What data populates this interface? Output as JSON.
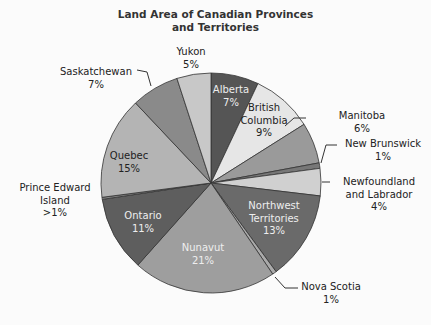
{
  "chart_data": {
    "type": "pie",
    "title": "Land Area of Canadian Provinces and Territories",
    "title_lines": [
      "Land Area of Canadian Provinces",
      "and Territories"
    ],
    "start_angle_deg": 0,
    "direction": "clockwise",
    "slices": [
      {
        "name": "Alberta",
        "label": "Alberta",
        "pct_label": "7%",
        "value": 7,
        "color": "#555555"
      },
      {
        "name": "British Columbia",
        "label": "British Columbia",
        "pct_label": "9%",
        "value": 9,
        "color": "#e6e6e6"
      },
      {
        "name": "Manitoba",
        "label": "Manitoba",
        "pct_label": "6%",
        "value": 6,
        "color": "#9a9a9a"
      },
      {
        "name": "New Brunswick",
        "label": "New Brunswick",
        "pct_label": "1%",
        "value": 0.8,
        "color": "#777777"
      },
      {
        "name": "Newfoundland and Labrador",
        "label": "Newfoundland and Labrador",
        "pct_label": "4%",
        "value": 4,
        "color": "#d0d0d0"
      },
      {
        "name": "Northwest Territories",
        "label": "Northwest Territories",
        "pct_label": "13%",
        "value": 13,
        "color": "#6a6a6a"
      },
      {
        "name": "Nova Scotia",
        "label": "Nova Scotia",
        "pct_label": "1%",
        "value": 0.6,
        "color": "#aaaaaa"
      },
      {
        "name": "Nunavut",
        "label": "Nunavut",
        "pct_label": "21%",
        "value": 21,
        "color": "#9e9e9e"
      },
      {
        "name": "Ontario",
        "label": "Ontario",
        "pct_label": "11%",
        "value": 11,
        "color": "#5e5e5e"
      },
      {
        "name": "Prince Edward Island",
        "label": "Prince Edward Island",
        "pct_label": ">1%",
        "value": 0.3,
        "color": "#888888"
      },
      {
        "name": "Quebec",
        "label": "Quebec",
        "pct_label": "15%",
        "value": 15,
        "color": "#b4b4b4"
      },
      {
        "name": "Saskatchewan",
        "label": "Saskatchewan",
        "pct_label": "7%",
        "value": 7,
        "color": "#8a8a8a"
      },
      {
        "name": "Yukon",
        "label": "Yukon",
        "pct_label": "5%",
        "value": 5,
        "color": "#c8c8c8"
      }
    ],
    "legend": "none (callout labels)"
  },
  "labels": {
    "alberta": [
      "Alberta",
      "7%"
    ],
    "bc": [
      "British",
      "Columbia",
      "9%"
    ],
    "manitoba": [
      "Manitoba",
      "6%"
    ],
    "nb": [
      "New Brunswick",
      "1%"
    ],
    "nl": [
      "Newfoundland",
      "and Labrador",
      "4%"
    ],
    "nwt": [
      "Northwest",
      "Territories",
      "13%"
    ],
    "ns": [
      "Nova Scotia",
      "1%"
    ],
    "nunavut": [
      "Nunavut",
      "21%"
    ],
    "ontario": [
      "Ontario",
      "11%"
    ],
    "pei": [
      "Prince Edward",
      "Island",
      ">1%"
    ],
    "quebec": [
      "Quebec",
      "15%"
    ],
    "sask": [
      "Saskatchewan",
      "7%"
    ],
    "yukon": [
      "Yukon",
      "5%"
    ]
  }
}
